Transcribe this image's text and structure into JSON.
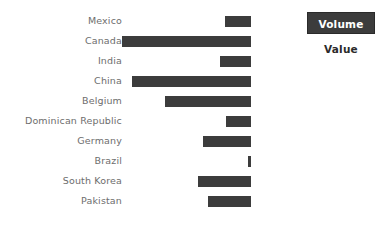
{
  "chart_data": {
    "type": "bar",
    "orientation": "horizontal",
    "title": "",
    "subtitle": "",
    "xlabel": "",
    "ylabel": "",
    "grid": false,
    "axis_visible": false,
    "tick_labels_visible": false,
    "bar_alignment": "right",
    "categories": [
      "Mexico",
      "Canada",
      "India",
      "China",
      "Belgium",
      "Dominican Republic",
      "Germany",
      "Brazil",
      "South Korea",
      "Pakistan"
    ],
    "series": [
      {
        "name": "Volume",
        "values": [
          18,
          88,
          21,
          81,
          59,
          17,
          33,
          2,
          36,
          29
        ]
      }
    ],
    "values": [
      18,
      88,
      21,
      81,
      59,
      17,
      33,
      2,
      36,
      29
    ],
    "xlim": [
      0,
      88
    ],
    "bar_color": "#3c3c3c",
    "label_color": "#6d6d6d",
    "background_color": "#ffffff",
    "legend": {
      "position": "top-right",
      "entries": [
        {
          "label": "Volume",
          "selected": true
        },
        {
          "label": "Value",
          "selected": false
        }
      ]
    }
  },
  "legend": {
    "volume_label": "Volume",
    "value_label": "Value",
    "selected_bg": "#3c3c3c",
    "selected_fg": "#ffffff",
    "plain_fg": "#2b2b2b"
  },
  "rows": [
    {
      "label": "Mexico",
      "value": 18
    },
    {
      "label": "Canada",
      "value": 88
    },
    {
      "label": "India",
      "value": 21
    },
    {
      "label": "China",
      "value": 81
    },
    {
      "label": "Belgium",
      "value": 59
    },
    {
      "label": "Dominican Republic",
      "value": 17
    },
    {
      "label": "Germany",
      "value": 33
    },
    {
      "label": "Brazil",
      "value": 2
    },
    {
      "label": "South Korea",
      "value": 36
    },
    {
      "label": "Pakistan",
      "value": 29
    }
  ]
}
